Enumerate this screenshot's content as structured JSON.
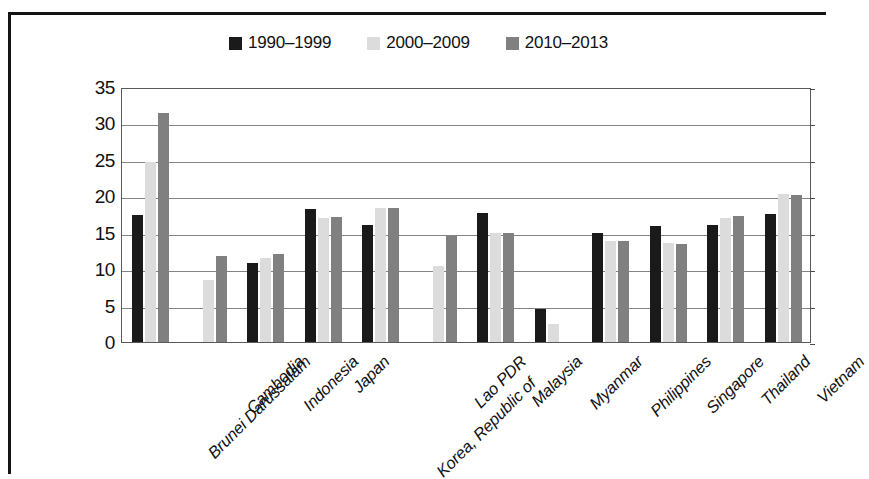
{
  "chart_data": {
    "type": "bar",
    "title": "",
    "subtitle": "",
    "xlabel": "",
    "ylabel": "",
    "ylim": [
      0,
      35
    ],
    "ytick_step": 5,
    "yticks": [
      35,
      30,
      25,
      20,
      15,
      10,
      5,
      0
    ],
    "grid": true,
    "legend_position": "top-center",
    "orientation": "vertical",
    "categories": [
      "Brunei Darussalam",
      "Cambodia",
      "Indonesia",
      "Japan",
      "Korea, Republic of",
      "Lao PDR",
      "Malaysia",
      "Myanmar",
      "Philippines",
      "Singapore",
      "Thailand",
      "Vietnam"
    ],
    "series": [
      {
        "name": "1990–1999",
        "color": "#1a1a1a",
        "values": [
          17.4,
          null,
          10.8,
          18.3,
          16.1,
          null,
          17.7,
          4.5,
          15.0,
          15.9,
          16.1,
          17.6
        ]
      },
      {
        "name": "2000–2009",
        "color": "#dcdcdc",
        "values": [
          24.7,
          8.5,
          11.5,
          17.0,
          18.4,
          10.5,
          15.0,
          2.5,
          13.9,
          13.6,
          17.0,
          20.3
        ]
      },
      {
        "name": "2010–2013",
        "color": "#808080",
        "values": [
          31.5,
          11.8,
          12.1,
          17.2,
          18.4,
          14.6,
          14.9,
          null,
          13.9,
          13.5,
          17.3,
          20.2
        ]
      }
    ]
  },
  "legend": {
    "items": [
      {
        "label": "1990–1999",
        "swatch": "legend-swatch-black",
        "color": "#1a1a1a"
      },
      {
        "label": "2000–2009",
        "swatch": "legend-swatch-light-gray",
        "color": "#dcdcdc"
      },
      {
        "label": "2010–2013",
        "swatch": "legend-swatch-medium-gray",
        "color": "#808080"
      }
    ]
  },
  "axes": {
    "y_tick_labels": [
      "35",
      "30",
      "25",
      "20",
      "15",
      "10",
      "5",
      "0"
    ],
    "x_tick_labels": [
      "Brunei Darussalam",
      "Cambodia",
      "Indonesia",
      "Japan",
      "Korea, Republic of",
      "Lao PDR",
      "Malaysia",
      "Myanmar",
      "Philippines",
      "Singapore",
      "Thailand",
      "Vietnam"
    ]
  }
}
